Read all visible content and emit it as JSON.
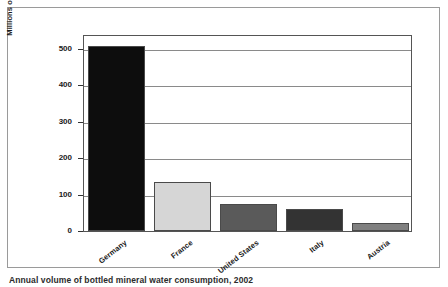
{
  "chart_data": {
    "type": "bar",
    "title": "",
    "xlabel": "",
    "ylabel": "Millions of gallons",
    "categories": [
      "Germany",
      "France",
      "United States",
      "Italy",
      "Austria"
    ],
    "values": [
      508,
      133,
      75,
      60,
      22
    ],
    "bar_colors": [
      "#0d0d0d",
      "#d6d6d6",
      "#5a5a5a",
      "#333333",
      "#808080"
    ],
    "bar_border_color": "#4a4a4a",
    "ylim": [
      0,
      540
    ],
    "yticks": [
      0,
      100,
      200,
      300,
      400,
      500
    ],
    "ytick_labels": [
      "0",
      "100",
      "200",
      "300",
      "400",
      "500"
    ],
    "grid": true,
    "grid_color": "#8a8a8a",
    "legend": "none",
    "frame_color": "#555555",
    "background": "#ffffff"
  },
  "figure": {
    "border_color": "#9a9a9a"
  },
  "caption": {
    "text": "Annual volume of bottled mineral water consumption, 2002"
  }
}
